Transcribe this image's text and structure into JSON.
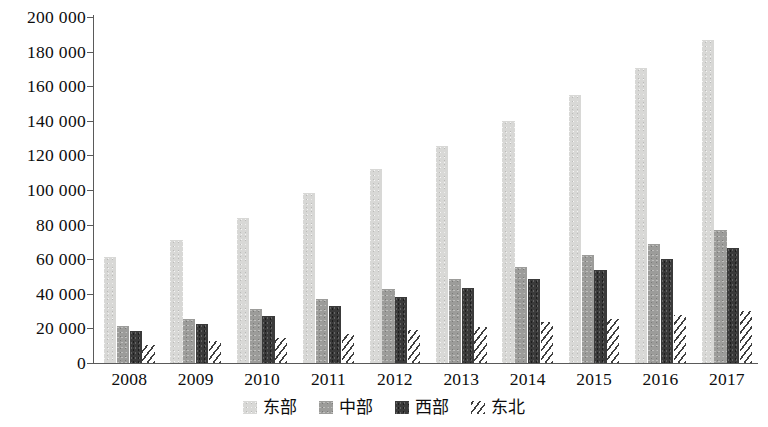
{
  "chart_data": {
    "type": "bar",
    "title": "",
    "subtitle": "",
    "xlabel": "",
    "ylabel": "",
    "categories": [
      "2008",
      "2009",
      "2010",
      "2011",
      "2012",
      "2013",
      "2014",
      "2015",
      "2016",
      "2017"
    ],
    "series": [
      {
        "name": "东部",
        "color": "#d8d8d6",
        "pattern": "solid-light-gray",
        "values": [
          61000,
          71000,
          84000,
          98000,
          112000,
          125500,
          140000,
          155000,
          170500,
          187000
        ]
      },
      {
        "name": "中部",
        "color": "#9c9c9a",
        "pattern": "solid-medium-gray",
        "values": [
          21500,
          25500,
          31000,
          37000,
          43000,
          48500,
          55500,
          62500,
          69000,
          77000
        ]
      },
      {
        "name": "西部",
        "color": "#3a3a3a",
        "pattern": "solid-dark-gray",
        "values": [
          18500,
          22500,
          27000,
          33000,
          38000,
          43500,
          48500,
          54000,
          60000,
          66500
        ]
      },
      {
        "name": "东北",
        "color": "#3f3f3f",
        "pattern": "diagonal-hatch",
        "values": [
          10500,
          12500,
          14500,
          16500,
          19000,
          21000,
          23500,
          25500,
          27500,
          30000
        ]
      }
    ],
    "ylim": [
      0,
      200000
    ],
    "yticks": [
      0,
      20000,
      40000,
      60000,
      80000,
      100000,
      120000,
      140000,
      160000,
      180000,
      200000
    ],
    "ytick_labels": [
      "0",
      "20 000",
      "40 000",
      "60 000",
      "80 000",
      "100 000",
      "120 000",
      "140 000",
      "160 000",
      "180 000",
      "200 000"
    ],
    "grid": false,
    "legend_position": "bottom",
    "legend": [
      "东部",
      "中部",
      "西部",
      "东北"
    ]
  }
}
